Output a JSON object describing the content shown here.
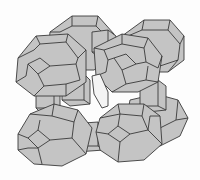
{
  "figure": {
    "title": "Zeolite framework: sodalite cages linked by double 4-rings",
    "colors": {
      "background": "#fdfdfd",
      "fill": "#c4c4c4",
      "edge": "#3a3a3a",
      "pore": "#f4f4f4"
    },
    "components": {
      "sodalite_cages_front": 4,
      "sodalite_cages_back": 4,
      "double_four_ring_links": "cubes between cages",
      "central_pore": "open channel visible through center"
    }
  }
}
